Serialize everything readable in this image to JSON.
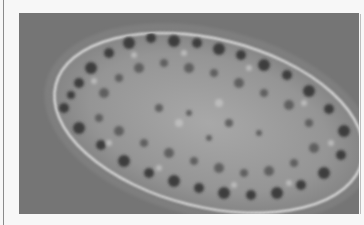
{
  "figure": {
    "colors": {
      "page_background": "#f7f7f7",
      "photo_background": "#757575",
      "cell_body": "#9a9a9a",
      "cell_rim": "#d8d8d8",
      "inclusions": "#3a3a3a"
    }
  }
}
